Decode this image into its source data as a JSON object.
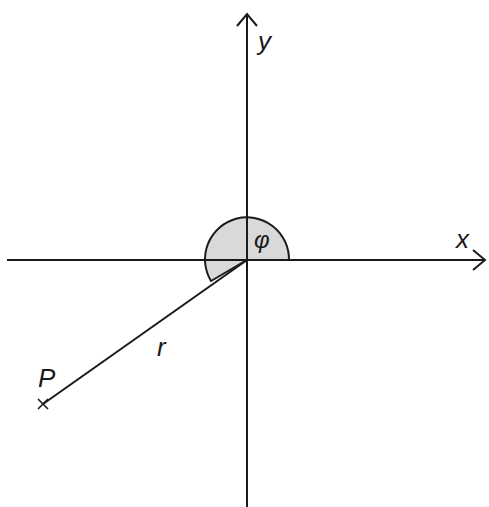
{
  "diagram": {
    "type": "polar-coordinates",
    "axes": {
      "x_label": "x",
      "y_label": "y"
    },
    "point": {
      "label": "P",
      "marker": "cross"
    },
    "radius_label": "r",
    "angle_label": "φ",
    "colors": {
      "stroke": "#1a1a1a",
      "angle_fill": "#d9d9d9"
    }
  }
}
